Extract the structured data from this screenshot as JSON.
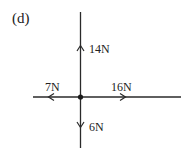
{
  "diagram": {
    "label": "(d)",
    "type": "free-body force diagram",
    "forces": [
      {
        "name": "up",
        "direction": "up",
        "label": "14N",
        "magnitude": 14,
        "unit": "N"
      },
      {
        "name": "left",
        "direction": "left",
        "label": "7N",
        "magnitude": 7,
        "unit": "N"
      },
      {
        "name": "right",
        "direction": "right",
        "label": "16N",
        "magnitude": 16,
        "unit": "N"
      },
      {
        "name": "down",
        "direction": "down",
        "label": "6N",
        "magnitude": 6,
        "unit": "N"
      }
    ],
    "colors": {
      "line": "#2a2a2a",
      "background": "#ffffff"
    }
  }
}
